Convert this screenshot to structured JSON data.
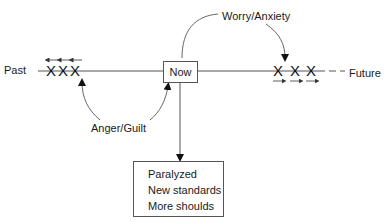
{
  "diagram": {
    "timeline": {
      "left_label": "Past",
      "center_label": "Now",
      "right_label": "Future"
    },
    "past_markers": [
      "X",
      "X",
      "X"
    ],
    "future_markers": [
      "X",
      "X",
      "X"
    ],
    "arcs": {
      "top": "Worry/Anxiety",
      "bottom": "Anger/Guilt"
    },
    "outcome_box": {
      "lines": [
        "Paralyzed",
        "New standards",
        "More shoulds"
      ]
    },
    "colors": {
      "line": "#555555",
      "text": "#1a1a1a",
      "background": "#ffffff"
    }
  }
}
